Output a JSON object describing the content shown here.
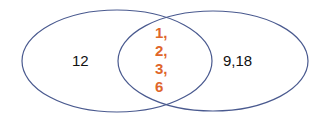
{
  "diagram": {
    "type": "venn",
    "colors": {
      "outline": "#4a5a8f",
      "intersection_text": "#e0662a",
      "text": "#111111"
    },
    "sets": [
      {
        "name": "left-set",
        "only": "12"
      },
      {
        "name": "right-set",
        "only": "9,18"
      }
    ],
    "intersection": [
      "1,",
      "2,",
      "3,",
      "6"
    ]
  }
}
